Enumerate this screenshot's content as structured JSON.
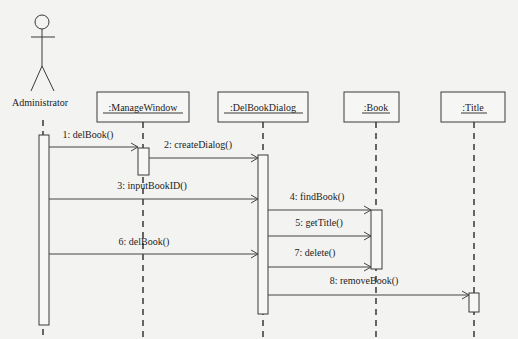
{
  "diagram": {
    "type": "uml-sequence-diagram",
    "actor": {
      "name": "Administrator"
    },
    "objects": [
      {
        "id": "mw",
        "label": ":ManageWindow"
      },
      {
        "id": "dlg",
        "label": ":DelBookDialog"
      },
      {
        "id": "book",
        "label": ":Book"
      },
      {
        "id": "title",
        "label": ":Title"
      }
    ],
    "messages": [
      {
        "seq": 1,
        "label": "1: delBook()",
        "from": "admin",
        "to": "mw"
      },
      {
        "seq": 2,
        "label": "2: createDialog()",
        "from": "mw",
        "to": "dlg"
      },
      {
        "seq": 3,
        "label": "3: inputBookID()",
        "from": "admin",
        "to": "dlg"
      },
      {
        "seq": 4,
        "label": "4: findBook()",
        "from": "dlg",
        "to": "book"
      },
      {
        "seq": 5,
        "label": "5: getTitle()",
        "from": "dlg",
        "to": "book"
      },
      {
        "seq": 6,
        "label": "6: delBook()",
        "from": "admin",
        "to": "dlg"
      },
      {
        "seq": 7,
        "label": "7: delete()",
        "from": "dlg",
        "to": "book"
      },
      {
        "seq": 8,
        "label": "8: removeBook()",
        "from": "dlg",
        "to": "title"
      }
    ]
  }
}
